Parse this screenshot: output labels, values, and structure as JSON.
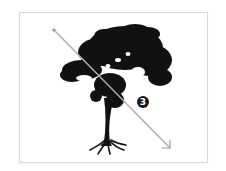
{
  "figure": {
    "frame_color": "#d9d9d9",
    "tree_color": "#111111",
    "arrow": {
      "color": "#9a9a9a",
      "start": [
        54,
        30
      ],
      "end": [
        170,
        148
      ],
      "direction": "top-left to bottom-right"
    },
    "marker": {
      "label": "3",
      "style": "filled-black-circle",
      "position": [
        143,
        102
      ]
    }
  }
}
